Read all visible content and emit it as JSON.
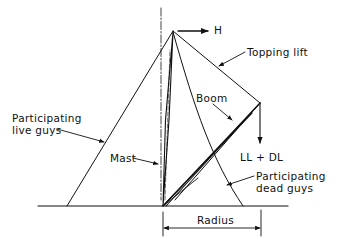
{
  "diagram": {
    "stroke_color": "#111111",
    "background": "#ffffff",
    "labels": {
      "horizontal_force": "H",
      "topping_lift": "Topping lift",
      "boom": "Boom",
      "live_guys_line1": "Participating",
      "live_guys_line2": "live guys",
      "mast": "Mast",
      "load": "LL + DL",
      "dead_guys_line1": "Participating",
      "dead_guys_line2": "dead guys",
      "radius": "Radius"
    },
    "elements": [
      {
        "name": "mast",
        "from": [
          163,
          206
        ],
        "to": [
          173,
          32
        ]
      },
      {
        "name": "mast-centerline",
        "type": "dash-dot",
        "from": [
          161,
          8
        ],
        "to": [
          161,
          200
        ]
      },
      {
        "name": "boom",
        "from": [
          163,
          206
        ],
        "to": [
          260,
          103
        ]
      },
      {
        "name": "topping-lift",
        "from": [
          173,
          32
        ],
        "to": [
          260,
          103
        ]
      },
      {
        "name": "live-guy",
        "from": [
          173,
          32
        ],
        "to": [
          67,
          206
        ]
      },
      {
        "name": "dead-guy",
        "type": "curve",
        "from": [
          173,
          32
        ],
        "to": [
          243,
          206
        ]
      },
      {
        "name": "ground-line",
        "from": [
          38,
          206
        ],
        "to": [
          288,
          206
        ]
      },
      {
        "name": "horizontal-force-arrow",
        "from": [
          178,
          31
        ],
        "to": [
          208,
          31
        ]
      },
      {
        "name": "load-arrow",
        "from": [
          260,
          103
        ],
        "to": [
          260,
          142
        ]
      },
      {
        "name": "radius-dimension",
        "from": [
          163,
          228
        ],
        "to": [
          261,
          228
        ]
      }
    ]
  }
}
